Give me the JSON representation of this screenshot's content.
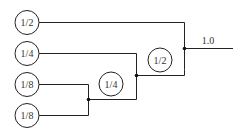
{
  "diagram": {
    "type": "binary-merge-tree",
    "inputs": [
      {
        "label": "1/2"
      },
      {
        "label": "1/4"
      },
      {
        "label": "1/8"
      },
      {
        "label": "1/8"
      }
    ],
    "intermediate_nodes": [
      {
        "label": "1/4"
      },
      {
        "label": "1/2"
      }
    ],
    "output": {
      "label": "1.0"
    }
  }
}
